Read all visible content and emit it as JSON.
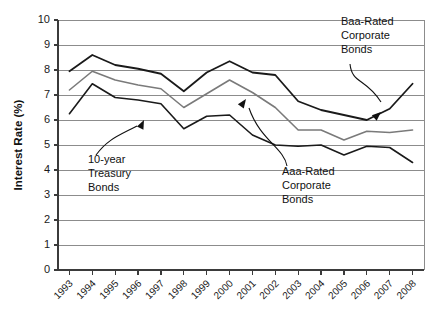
{
  "chart_data": {
    "type": "line",
    "title": "",
    "xlabel": "",
    "ylabel": "Interest Rate (%)",
    "ylim": [
      0,
      10
    ],
    "ytick_step": 1,
    "yticks": [
      "0",
      "1",
      "2",
      "3",
      "4",
      "5",
      "6",
      "7",
      "8",
      "9",
      "10"
    ],
    "grid": true,
    "grid_axis": "y",
    "legend_position": "annotations-inline",
    "categories": [
      "1993",
      "1994",
      "1995",
      "1996",
      "1997",
      "1998",
      "1999",
      "2000",
      "2001",
      "2002",
      "2003",
      "2004",
      "2005",
      "2006",
      "2007",
      "2008"
    ],
    "series": [
      {
        "name": "Baa-Rated Corporate Bonds",
        "color": "#1a1a1a",
        "width": 1.8,
        "values": [
          7.95,
          8.6,
          8.2,
          8.05,
          7.85,
          7.15,
          7.9,
          8.35,
          7.9,
          7.8,
          6.75,
          6.4,
          6.2,
          6.0,
          6.45,
          7.45
        ]
      },
      {
        "name": "Aaa-Rated Corporate Bonds",
        "color": "#7a7a7a",
        "width": 1.6,
        "values": [
          7.2,
          7.95,
          7.6,
          7.4,
          7.25,
          6.5,
          7.05,
          7.6,
          7.1,
          6.5,
          5.6,
          5.6,
          5.2,
          5.55,
          5.5,
          5.6
        ]
      },
      {
        "name": "10-year Treasury Bonds",
        "color": "#1a1a1a",
        "width": 1.6,
        "values": [
          6.25,
          7.45,
          6.9,
          6.8,
          6.65,
          5.65,
          6.15,
          6.2,
          5.4,
          5.0,
          4.95,
          5.0,
          4.6,
          4.95,
          4.9,
          4.3
        ]
      }
    ],
    "annotations": [
      {
        "id": "baa",
        "lines": [
          "Baa-Rated",
          "Corporate",
          "Bonds"
        ],
        "text_x": 341,
        "text_y": 25,
        "leader": "M 350 64 C 352 84, 366 78, 381 102",
        "arrow_x": 381,
        "arrow_y": 112
      },
      {
        "id": "treasury",
        "lines": [
          "10-year",
          "Treasury",
          "Bonds"
        ],
        "text_x": 88,
        "text_y": 163,
        "leader": "M 96 155 C 108 139, 118 136, 137 126",
        "arrow_x": 144,
        "arrow_y": 120
      },
      {
        "id": "aaa",
        "lines": [
          "Aaa-Rated",
          "Corporate",
          "Bonds"
        ],
        "text_x": 282,
        "text_y": 175,
        "leader": "M 287 166 C 284 148, 260 140, 249 108",
        "arrow_x": 246,
        "arrow_y": 99
      }
    ]
  }
}
